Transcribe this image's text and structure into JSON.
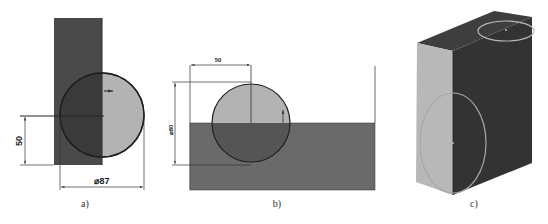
{
  "figure": {
    "panels": [
      {
        "id": "a",
        "caption": "a)",
        "dimensions": {
          "vertical_label": "50",
          "horizontal_label": "⌀87"
        }
      },
      {
        "id": "b",
        "caption": "b)",
        "dimensions": {
          "horizontal_label": "50",
          "vertical_label": "⌀80"
        }
      },
      {
        "id": "c",
        "caption": "c)"
      }
    ]
  },
  "colors": {
    "dark_fill": "#4a4a4a",
    "mid_fill": "#6a6a6a",
    "light_fill": "#b3b3b3",
    "circle_overlap": "#3a3a3a",
    "outline": "#1e1e1e",
    "highlight_ring": "#b8b8b8",
    "line": "#333333"
  }
}
